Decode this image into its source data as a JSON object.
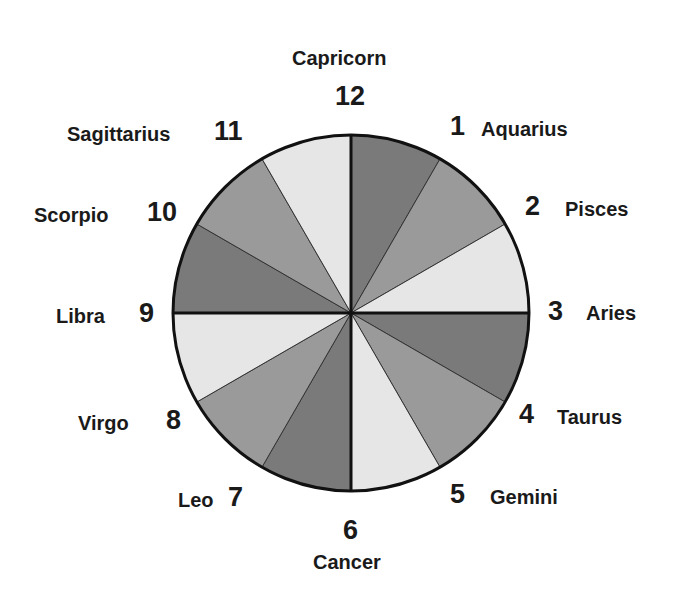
{
  "diagram": {
    "type": "zodiac-house-wheel",
    "center": [
      351,
      313
    ],
    "radius": 178,
    "colors": {
      "dark": "#7a7a7a",
      "medium": "#9a9a9a",
      "light": "#e6e6e6",
      "stroke": "#111111"
    },
    "houses": [
      {
        "number": "1",
        "sign": "Aquarius",
        "shade": "dark"
      },
      {
        "number": "2",
        "sign": "Pisces",
        "shade": "medium"
      },
      {
        "number": "3",
        "sign": "Aries",
        "shade": "light"
      },
      {
        "number": "4",
        "sign": "Taurus",
        "shade": "dark"
      },
      {
        "number": "5",
        "sign": "Gemini",
        "shade": "medium"
      },
      {
        "number": "6",
        "sign": "Cancer",
        "shade": "light"
      },
      {
        "number": "7",
        "sign": "Leo",
        "shade": "dark"
      },
      {
        "number": "8",
        "sign": "Virgo",
        "shade": "medium"
      },
      {
        "number": "9",
        "sign": "Libra",
        "shade": "light"
      },
      {
        "number": "10",
        "sign": "Scorpio",
        "shade": "dark"
      },
      {
        "number": "11",
        "sign": "Sagittarius",
        "shade": "medium"
      },
      {
        "number": "12",
        "sign": "Capricorn",
        "shade": "light"
      }
    ]
  }
}
